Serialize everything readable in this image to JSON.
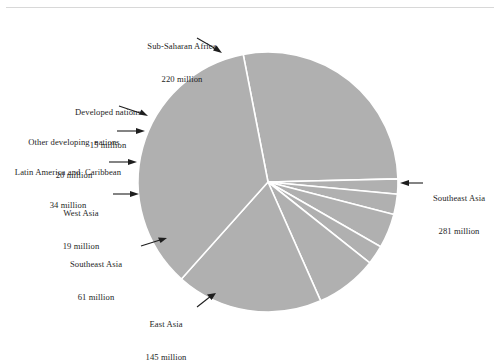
{
  "figure": {
    "name": "pie-chart-illiterate-population",
    "background_color": "#ffffff",
    "slice_fill": "#b0b0b0",
    "slice_edge": "#ffffff",
    "text_color": "#1e1e1e",
    "rule_color": "#d8d8d8",
    "units": "million"
  },
  "chart_data": {
    "type": "pie",
    "title": "",
    "subtitle": "",
    "xlabel": "",
    "ylabel": "",
    "grid": false,
    "legend_position": "callout-labels",
    "total": 795,
    "unit_label": "million",
    "start_angle_deg": -101,
    "direction": "clockwise",
    "center": {
      "x": 268,
      "y": 182
    },
    "radius": 130,
    "categories": [
      "Sub-Saharan Africa",
      "Developed nations",
      "Other developing  nations",
      "Latin America and  Caribbean",
      "West Asia",
      "Southeast Asia",
      "East Asia",
      "Southeast Asia"
    ],
    "values": [
      220,
      15,
      20,
      34,
      19,
      61,
      145,
      281
    ],
    "slices": [
      {
        "label": "Sub-Saharan Africa",
        "value": 220,
        "value_text": "220 million",
        "angle_deg": 99.6,
        "percent": 27.7
      },
      {
        "label": "Developed nations",
        "value": 15,
        "value_text": "15 million",
        "angle_deg": 6.8,
        "percent": 1.9
      },
      {
        "label": "Other developing  nations",
        "value": 20,
        "value_text": "20 million",
        "angle_deg": 9.1,
        "percent": 2.5
      },
      {
        "label": "Latin America and  Caribbean",
        "value": 34,
        "value_text": "34 million",
        "angle_deg": 15.4,
        "percent": 4.3
      },
      {
        "label": "West Asia",
        "value": 19,
        "value_text": "19 million",
        "angle_deg": 8.6,
        "percent": 2.4
      },
      {
        "label": "Southeast Asia",
        "value": 61,
        "value_text": "61 million",
        "angle_deg": 27.6,
        "percent": 7.7
      },
      {
        "label": "East Asia",
        "value": 145,
        "value_text": "145 million",
        "angle_deg": 65.7,
        "percent": 18.2
      },
      {
        "label": "Southeast Asia",
        "value": 281,
        "value_text": "281 million",
        "angle_deg": 127.2,
        "percent": 35.3
      }
    ]
  },
  "callouts": {
    "sub_saharan_africa": {
      "line1": "Sub-Saharan Africa",
      "line2": "220 million"
    },
    "developed_nations": {
      "line1": "Developed nations",
      "line2": "15 million"
    },
    "other_developing": {
      "line1": "Other developing  nations",
      "line2": "20 million"
    },
    "latin_america": {
      "line1": "Latin America and  Caribbean",
      "line2": "34 million"
    },
    "west_asia": {
      "line1": "West Asia",
      "line2": "19 million"
    },
    "southeast_asia_61": {
      "line1": "Southeast Asia",
      "line2": "61 million"
    },
    "east_asia": {
      "line1": "East Asia",
      "line2": "145 million"
    },
    "southeast_asia_281": {
      "line1": "Southeast Asia",
      "line2": "281 million"
    }
  }
}
